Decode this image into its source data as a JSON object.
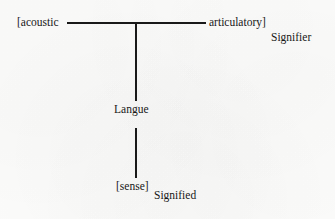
{
  "diagram": {
    "stroke_color": "#191919",
    "background_color": "#fcfcfb",
    "text_color": "#171717",
    "nodes": [
      {
        "id": "acoustic",
        "label": "[acoustic"
      },
      {
        "id": "articulatory",
        "label": "articulatory]"
      },
      {
        "id": "langue",
        "label": "Langue"
      },
      {
        "id": "sense",
        "label": "[sense]"
      }
    ],
    "annotations": [
      {
        "id": "signifier",
        "label": "Signifier"
      },
      {
        "id": "signified",
        "label": "Signified"
      }
    ],
    "connectors": [
      {
        "id": "horizontal",
        "orientation": "horizontal",
        "from": "acoustic",
        "to": "articulatory"
      },
      {
        "id": "vertical-upper",
        "orientation": "vertical",
        "from": "crossbar",
        "to": "langue"
      },
      {
        "id": "vertical-lower",
        "orientation": "vertical",
        "from": "langue",
        "to": "sense"
      }
    ]
  }
}
